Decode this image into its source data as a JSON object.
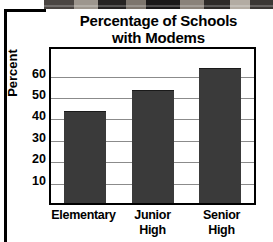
{
  "figure": {
    "title_line1": "Percentage of Schools",
    "title_line2": "with Modems",
    "y_axis_title": "Percent"
  },
  "decor": {
    "photo_strip_name": "cropped-photograph-strip",
    "left_rule_name": "page-border-rule"
  },
  "chart_data": {
    "type": "bar",
    "title": "Percentage of Schools with Modems",
    "xlabel": "",
    "ylabel": "Percent",
    "ylim": [
      0,
      72
    ],
    "yticks": [
      60,
      50,
      40,
      30,
      20,
      10
    ],
    "grid": true,
    "legend": "none",
    "categories": [
      "Elementary",
      "Junior High",
      "Senior High"
    ],
    "category_lines": [
      [
        "Elementary"
      ],
      [
        "Junior",
        "High"
      ],
      [
        "Senior",
        "High"
      ]
    ],
    "values": [
      43,
      53,
      63
    ],
    "bar_color": "#3a3a3a",
    "gridline_color": "#8b8b8b",
    "frame_color": "#000000"
  }
}
